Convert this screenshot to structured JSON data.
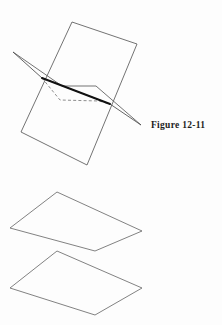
{
  "page": {
    "background_color": "#fdfdfd",
    "width": 222,
    "height": 325,
    "kind": "textbook-geometry-line-figures"
  },
  "figures": [
    {
      "id": "figure-12-11",
      "caption": "Figure 12-11",
      "description": "Two intersecting planes: a vertical quadrilateral plane cut by a horizontal plane, with the line of intersection drawn heavy and the hidden rear edge dashed.",
      "line_color": "#555555",
      "emphasis_color": "#1a1a1a",
      "hidden_line_style": "dashed",
      "shapes": {
        "vertical_plane": {
          "name": "vertical-plane",
          "points": "72,22 137,44 87,165 21,132"
        },
        "horizontal_plane_front": {
          "name": "horizontal-plane-front-edge",
          "points": "13,52 42,78 110,104 141,125"
        },
        "horizontal_plane_back": {
          "name": "horizontal-plane-back-edge",
          "points": "13,52 62,86 96,86 141,125"
        },
        "hidden_edge": {
          "name": "horizontal-plane-hidden-edge",
          "points": "42,78 62,101 100,101 110,104"
        },
        "intersection_line": {
          "name": "line-of-intersection",
          "points": "42,78 110,104"
        }
      }
    },
    {
      "id": "figure-12-12",
      "caption": "Figure 12-12",
      "description": "Two parallel planes shown as two non-intersecting parallelograms stacked vertically.",
      "line_color": "#6b6b6b",
      "shapes": {
        "upper_plane": {
          "name": "upper-parallel-plane",
          "points": "10,228 57,192 142,231 95,251"
        },
        "lower_plane": {
          "name": "lower-parallel-plane",
          "points": "10,288 57,251 142,288 95,315"
        }
      }
    }
  ]
}
